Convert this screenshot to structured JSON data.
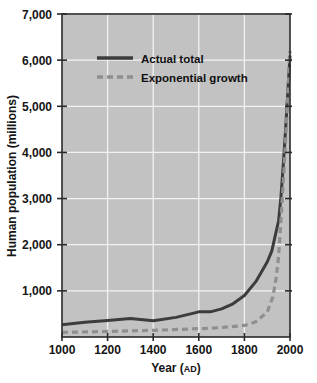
{
  "chart_data": {
    "type": "line",
    "title": "",
    "xlabel": "Year (AD)",
    "xlabel_main": "Year (",
    "xlabel_smallcaps": "AD",
    "xlabel_close": ")",
    "ylabel": "Human population (millions)",
    "xlim": [
      1000,
      2000
    ],
    "ylim": [
      0,
      7000
    ],
    "grid": true,
    "legend_position": "top-left-inside",
    "xticks": [
      1000,
      1200,
      1400,
      1600,
      1800,
      2000
    ],
    "xtick_labels": [
      "1000",
      "1200",
      "1400",
      "1600",
      "1800",
      "2000"
    ],
    "yticks": [
      1000,
      2000,
      3000,
      4000,
      5000,
      6000,
      7000
    ],
    "ytick_labels": [
      "1,000",
      "2,000",
      "3,000",
      "4,000",
      "5,000",
      "6,000",
      "7,000"
    ],
    "plot_background": "#c2c2c2",
    "gridline_color": "#f2f2f2",
    "axis_color": "#2b2b2b",
    "series": [
      {
        "name": "Actual total",
        "style": "solid",
        "color": "#3c3c3c",
        "x": [
          1000,
          1100,
          1200,
          1300,
          1400,
          1500,
          1600,
          1650,
          1700,
          1750,
          1800,
          1850,
          1900,
          1920,
          1940,
          1950,
          1960,
          1970,
          1980,
          1990,
          2000
        ],
        "y": [
          265,
          320,
          360,
          400,
          350,
          425,
          545,
          545,
          610,
          720,
          900,
          1200,
          1625,
          1860,
          2300,
          2520,
          3020,
          3700,
          4440,
          5280,
          6100
        ]
      },
      {
        "name": "Exponential growth",
        "style": "dashed",
        "color": "#8f8f8f",
        "x": [
          1000,
          1200,
          1400,
          1600,
          1700,
          1800,
          1850,
          1900,
          1925,
          1940,
          1950,
          1960,
          1970,
          1980,
          1990,
          2000
        ],
        "y": [
          100,
          120,
          145,
          180,
          205,
          250,
          330,
          540,
          870,
          1300,
          1750,
          2500,
          3300,
          4200,
          5200,
          6200
        ]
      }
    ]
  },
  "legend": {
    "entries": [
      {
        "label": "Actual total",
        "style": "solid",
        "color": "#3c3c3c"
      },
      {
        "label": "Exponential growth",
        "style": "dashed",
        "color": "#8f8f8f"
      }
    ]
  }
}
